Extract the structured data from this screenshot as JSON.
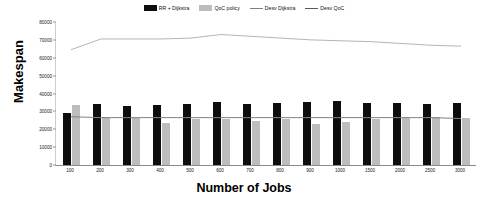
{
  "chart_data": {
    "type": "bar",
    "title": "",
    "xlabel": "Number of Jobs",
    "ylabel": "Makespan",
    "ylim": [
      0,
      80000
    ],
    "yticks": [
      0,
      10000,
      20000,
      30000,
      40000,
      50000,
      60000,
      70000,
      80000
    ],
    "grid": false,
    "legend_position": "top-center",
    "categories": [
      "100",
      "200",
      "300",
      "400",
      "500",
      "600",
      "700",
      "800",
      "900",
      "1000",
      "1500",
      "2000",
      "2500",
      "3000"
    ],
    "series": [
      {
        "name": "RR + Dijkstra",
        "kind": "bar",
        "color": "#0d0d0d",
        "values": [
          29000,
          34000,
          33000,
          33500,
          34000,
          35500,
          34000,
          34500,
          35500,
          36000,
          34500,
          34500,
          34000,
          34500
        ]
      },
      {
        "name": "QoC policy",
        "kind": "bar",
        "color": "#bdbdbd",
        "values": [
          33500,
          27000,
          26500,
          23500,
          25500,
          25500,
          24500,
          25500,
          23000,
          24000,
          25500,
          26500,
          27000,
          26500
        ]
      },
      {
        "name": "Desv Dijkstra",
        "kind": "line",
        "color": "#808080",
        "values": [
          27000,
          26500,
          26500,
          26500,
          26500,
          26500,
          26500,
          26500,
          26500,
          26500,
          26500,
          26500,
          26500,
          26000
        ]
      },
      {
        "name": "Desv QoC",
        "kind": "line",
        "color": "#b5b5b5",
        "values": [
          64500,
          70500,
          70500,
          70500,
          71000,
          73000,
          72000,
          71000,
          70000,
          69500,
          69000,
          68000,
          67000,
          66500
        ]
      }
    ]
  },
  "legend": {
    "items": [
      {
        "label": "RR + Dijkstra",
        "marker": "swatch",
        "color": "#0d0d0d"
      },
      {
        "label": "QoC policy",
        "marker": "swatch",
        "color": "#bdbdbd"
      },
      {
        "label": "Desv Dijkstra",
        "marker": "line",
        "color": "#808080"
      },
      {
        "label": "Desv QoC",
        "marker": "line",
        "color": "#5a5a5a"
      }
    ]
  }
}
